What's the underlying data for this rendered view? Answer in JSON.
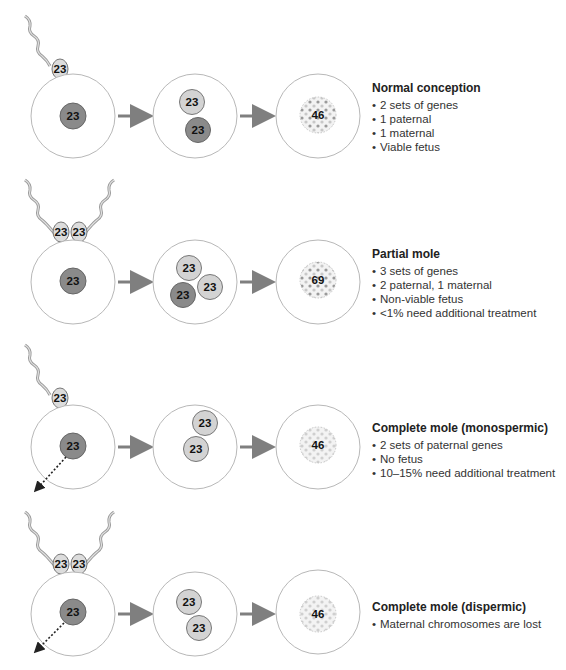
{
  "colors": {
    "cell_outline": "#b8b8b8",
    "paternal_nucleus": "#d0d0d0",
    "maternal_nucleus": "#8a8a8a",
    "nucleus_outline": "#707070",
    "arrow": "#7f7f7f",
    "dot_light": "#c8c8c8",
    "dot_dark": "#9a9a9a"
  },
  "rows": [
    {
      "title": "Normal conception",
      "bullets": [
        "2 sets of genes",
        "1 paternal",
        "1 maternal",
        "Viable fetus"
      ],
      "sperm_labels": [
        "23"
      ],
      "egg_nucleus": "23",
      "zygote_nuclei": [
        "23",
        "23"
      ],
      "result": "46"
    },
    {
      "title": "Partial mole",
      "bullets": [
        "3 sets of genes",
        "2 paternal, 1 maternal",
        "Non-viable fetus",
        "<1% need additional treatment"
      ],
      "sperm_labels": [
        "23",
        "23"
      ],
      "egg_nucleus": "23",
      "zygote_nuclei": [
        "23",
        "23",
        "23"
      ],
      "result": "69"
    },
    {
      "title": "Complete mole (monospermic)",
      "bullets": [
        "2 sets of paternal genes",
        "No fetus",
        "10–15% need additional treatment"
      ],
      "sperm_labels": [
        "23"
      ],
      "egg_nucleus": "23",
      "zygote_nuclei": [
        "23",
        "23"
      ],
      "result": "46"
    },
    {
      "title": "Complete mole (dispermic)",
      "bullets": [
        "Maternal chromosomes are lost"
      ],
      "sperm_labels": [
        "23",
        "23"
      ],
      "egg_nucleus": "23",
      "zygote_nuclei": [
        "23",
        "23"
      ],
      "result": "46"
    }
  ]
}
